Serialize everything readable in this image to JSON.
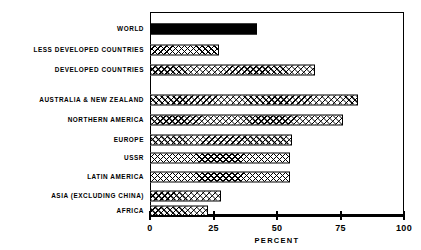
{
  "chart_data": {
    "type": "bar",
    "orientation": "horizontal",
    "title": "",
    "subtitle": "",
    "xlabel": "PERCENT",
    "ylabel": "",
    "xlim": [
      0,
      100
    ],
    "xticks": [
      0,
      25,
      50,
      75,
      100
    ],
    "xtick_labels": [
      "0",
      "25",
      "50",
      "75",
      "100"
    ],
    "grid": false,
    "legend": false,
    "legend_position": "none",
    "categories": [
      "WORLD",
      "LESS DEVELOPED COUNTRIES",
      "DEVELOPED COUNTRIES",
      "AUSTRALIA & NEW ZEALAND",
      "NORTHERN AMERICA",
      "EUROPE",
      "USSR",
      "LATIN AMERICA",
      "ASIA (EXCLUDING CHINA)",
      "AFRICA"
    ],
    "values": [
      42,
      27,
      65,
      82,
      76,
      56,
      55,
      55,
      28,
      23
    ],
    "bars": [
      {
        "label": "WORLD",
        "value": 42,
        "fill": "solid"
      },
      {
        "label": "LESS DEVELOPED COUNTRIES",
        "value": 27,
        "fill": "hatch"
      },
      {
        "label": "DEVELOPED COUNTRIES",
        "value": 65,
        "fill": "hatch"
      },
      {
        "label": "AUSTRALIA & NEW ZEALAND",
        "value": 82,
        "fill": "hatch"
      },
      {
        "label": "NORTHERN AMERICA",
        "value": 76,
        "fill": "hatch"
      },
      {
        "label": "EUROPE",
        "value": 56,
        "fill": "hatch"
      },
      {
        "label": "USSR",
        "value": 55,
        "fill": "hatch"
      },
      {
        "label": "LATIN AMERICA",
        "value": 55,
        "fill": "hatch"
      },
      {
        "label": "ASIA (EXCLUDING CHINA)",
        "value": 28,
        "fill": "hatch"
      },
      {
        "label": "AFRICA",
        "value": 23,
        "fill": "hatch"
      }
    ],
    "colors": {
      "axis": "#000000",
      "bar_outline": "#000000",
      "bar_solid": "#000000",
      "bar_hatch_background": "#ffffff",
      "plot_background": "#ffffff"
    }
  }
}
